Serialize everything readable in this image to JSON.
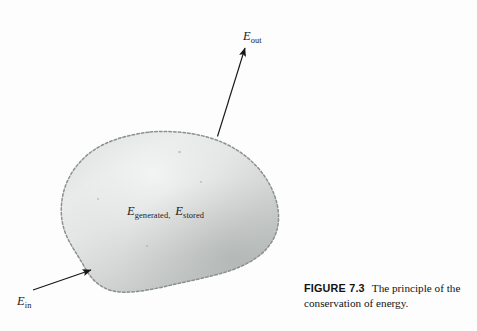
{
  "figure": {
    "domain_type": "diagram",
    "background_color": "#fdfdfd",
    "caption": {
      "figure_number": "FIGURE 7.3",
      "text": "The principle of the conservation of energy."
    },
    "control_volume": {
      "name": "control-volume-blob",
      "boundary_style": "dashed-scalloped",
      "boundary_color": "#8d9392",
      "fill_light": "#e8eae9",
      "fill_mid": "#d2d5d4",
      "fill_dark": "#b6bab9"
    },
    "labels": {
      "energy_out": {
        "symbol": "E",
        "subscript": "out"
      },
      "energy_in": {
        "symbol": "E",
        "subscript": "in"
      },
      "interior_first": {
        "symbol": "E",
        "subscript": "generated",
        "separator": ","
      },
      "interior_second": {
        "symbol": "E",
        "subscript": "stored"
      }
    },
    "arrows": {
      "out_arrow": {
        "name": "energy-out-arrow",
        "direction": "up-right",
        "color": "#171717"
      },
      "in_arrow": {
        "name": "energy-in-arrow",
        "direction": "up-right",
        "color": "#171717"
      }
    }
  }
}
